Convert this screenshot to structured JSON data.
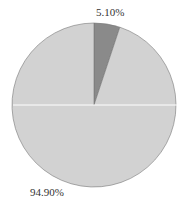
{
  "chart_data": {
    "type": "pie",
    "title": "",
    "categories": [
      "Slice A",
      "Slice B"
    ],
    "values": [
      5.1,
      94.9
    ],
    "labels": [
      "5.10%",
      "94.90%"
    ],
    "colors": [
      "#8a8a8a",
      "#d2d2d2"
    ],
    "start_angle_deg": 90,
    "direction": "clockwise",
    "legend": "none"
  },
  "labels": {
    "small": "5.10%",
    "large": "94.90%"
  }
}
